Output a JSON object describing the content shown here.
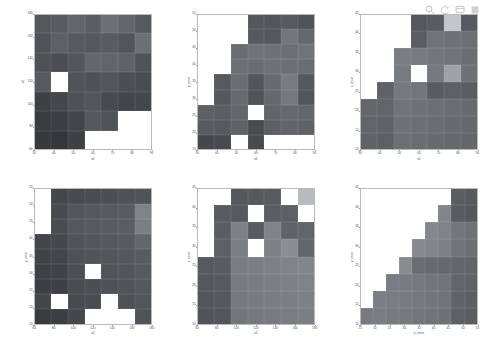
{
  "figure": {
    "background": "#ffffff",
    "layout": "2x3 subplot grid of pairwise 2-D histogram / heatmap panels",
    "empty_color": "#ffffff",
    "grid_line_color": "#b9b9b9"
  },
  "toolbar": {
    "items": [
      {
        "name": "zoom-icon",
        "label": "Zoom"
      },
      {
        "name": "pan-icon",
        "label": "Pan"
      },
      {
        "name": "datacursor-icon",
        "label": "Data Cursor"
      },
      {
        "name": "colorbar-icon",
        "label": "Colorbar"
      }
    ]
  },
  "chart_data": [
    {
      "id": "panel-x1-x2",
      "type": "heatmap",
      "title": "",
      "xlabel": "x1",
      "ylabel": "x2",
      "xticks": [
        30,
        40,
        50,
        60,
        70,
        80,
        90
      ],
      "yticks": [
        180,
        160,
        140,
        120,
        100,
        80,
        60
      ],
      "xlim": [
        25,
        95
      ],
      "ylim": [
        50,
        190
      ],
      "ncols": 7,
      "nrows": 7,
      "grid": true,
      "legend": "none",
      "note": "Values are cell shading levels (0 = darkest, 1 = brightest); null = empty / white cell",
      "values": [
        [
          0.2,
          0.22,
          0.26,
          0.23,
          0.31,
          0.27,
          0.21
        ],
        [
          0.18,
          0.24,
          0.21,
          0.2,
          0.22,
          0.19,
          0.31
        ],
        [
          0.17,
          0.16,
          0.19,
          0.27,
          0.26,
          0.25,
          0.18
        ],
        [
          0.21,
          1.0,
          0.18,
          0.17,
          0.19,
          0.16,
          0.15
        ],
        [
          0.1,
          0.13,
          0.17,
          0.19,
          0.14,
          0.12,
          0.13
        ],
        [
          0.08,
          0.09,
          0.12,
          0.2,
          0.18,
          null,
          null
        ],
        [
          0.07,
          0.06,
          0.1,
          null,
          null,
          null,
          null
        ]
      ]
    },
    {
      "id": "panel-x1-yerror",
      "type": "heatmap",
      "title": "",
      "xlabel": "x1",
      "ylabel": "y_error",
      "xticks": [
        30,
        40,
        50,
        60,
        70,
        80,
        90
      ],
      "yticks": [
        55,
        50,
        45,
        40,
        35,
        30,
        25,
        20,
        15
      ],
      "xlim": [
        25,
        95
      ],
      "ylim": [
        12,
        58
      ],
      "ncols": 7,
      "nrows": 9,
      "grid": true,
      "legend": "none",
      "values": [
        [
          null,
          null,
          null,
          0.2,
          0.19,
          0.21,
          0.18
        ],
        [
          null,
          null,
          null,
          0.21,
          0.2,
          0.34,
          0.28
        ],
        [
          null,
          null,
          0.3,
          0.33,
          0.32,
          0.31,
          0.33
        ],
        [
          null,
          null,
          0.31,
          0.3,
          0.32,
          0.31,
          0.3
        ],
        [
          null,
          0.21,
          0.3,
          0.19,
          0.29,
          0.36,
          0.2
        ],
        [
          null,
          0.2,
          0.29,
          0.18,
          0.28,
          0.35,
          0.19
        ],
        [
          0.24,
          0.23,
          0.27,
          1.0,
          0.26,
          0.28,
          0.27
        ],
        [
          0.22,
          0.21,
          0.25,
          0.15,
          0.24,
          0.26,
          0.25
        ],
        [
          0.13,
          0.14,
          null,
          0.14,
          null,
          null,
          null
        ]
      ]
    },
    {
      "id": "panel-x1-xerror",
      "type": "heatmap",
      "title": "",
      "xlabel": "x1",
      "ylabel": "x_error",
      "xticks": [
        30,
        40,
        50,
        60,
        70,
        80,
        90
      ],
      "yticks": [
        45,
        40,
        35,
        30,
        25,
        20,
        15,
        10
      ],
      "xlim": [
        25,
        95
      ],
      "ylim": [
        8,
        48
      ],
      "ncols": 7,
      "nrows": 8,
      "grid": true,
      "legend": "none",
      "values": [
        [
          null,
          null,
          null,
          0.2,
          0.22,
          0.72,
          0.21
        ],
        [
          null,
          null,
          null,
          0.23,
          0.33,
          0.32,
          0.31
        ],
        [
          null,
          null,
          0.37,
          0.36,
          0.34,
          0.33,
          0.3
        ],
        [
          null,
          null,
          0.36,
          1.0,
          0.35,
          0.55,
          0.32
        ],
        [
          null,
          0.25,
          0.35,
          0.34,
          0.22,
          0.24,
          0.23
        ],
        [
          0.27,
          0.26,
          0.33,
          0.32,
          0.31,
          0.3,
          0.29
        ],
        [
          0.26,
          0.25,
          0.32,
          0.31,
          0.3,
          0.29,
          0.28
        ],
        [
          0.25,
          0.24,
          0.31,
          0.3,
          0.29,
          0.28,
          0.27
        ]
      ]
    },
    {
      "id": "panel-x2-yerror",
      "type": "heatmap",
      "title": "",
      "xlabel": "x2",
      "ylabel": "y_error",
      "xticks": [
        60,
        80,
        100,
        120,
        140,
        160,
        180
      ],
      "yticks": [
        55,
        50,
        45,
        40,
        35,
        30,
        25,
        20,
        15
      ],
      "xlim": [
        50,
        190
      ],
      "ylim": [
        12,
        58
      ],
      "ncols": 7,
      "nrows": 9,
      "grid": true,
      "legend": "none",
      "values": [
        [
          null,
          0.13,
          0.14,
          0.15,
          0.16,
          0.17,
          0.18
        ],
        [
          null,
          0.14,
          0.19,
          0.2,
          0.21,
          0.22,
          0.4
        ],
        [
          null,
          0.15,
          0.2,
          0.21,
          0.22,
          0.23,
          0.38
        ],
        [
          0.12,
          0.13,
          0.18,
          0.19,
          0.2,
          0.21,
          0.27
        ],
        [
          0.11,
          0.12,
          0.17,
          0.18,
          0.19,
          0.2,
          0.22
        ],
        [
          0.1,
          0.11,
          0.16,
          1.0,
          0.18,
          0.19,
          0.21
        ],
        [
          0.09,
          0.1,
          0.15,
          0.16,
          0.17,
          0.18,
          0.2
        ],
        [
          0.12,
          1.0,
          0.14,
          0.15,
          null,
          0.17,
          0.19
        ],
        [
          0.08,
          0.09,
          0.13,
          null,
          null,
          null,
          0.18
        ]
      ]
    },
    {
      "id": "panel-x2-xerror",
      "type": "heatmap",
      "title": "",
      "xlabel": "x2",
      "ylabel": "x_error",
      "xticks": [
        60,
        80,
        100,
        120,
        140,
        160,
        180
      ],
      "yticks": [
        45,
        40,
        35,
        30,
        25,
        20,
        15,
        10
      ],
      "xlim": [
        50,
        190
      ],
      "ylim": [
        8,
        48
      ],
      "ncols": 7,
      "nrows": 8,
      "grid": true,
      "legend": "none",
      "values": [
        [
          null,
          null,
          0.2,
          0.21,
          0.22,
          null,
          0.66
        ],
        [
          null,
          0.22,
          0.21,
          1.0,
          0.23,
          0.24,
          null
        ],
        [
          null,
          0.23,
          0.39,
          0.22,
          0.4,
          0.25,
          0.26
        ],
        [
          null,
          0.24,
          0.38,
          1.0,
          0.39,
          0.45,
          0.27
        ],
        [
          0.21,
          0.22,
          0.37,
          0.38,
          0.39,
          0.4,
          0.41
        ],
        [
          0.2,
          0.21,
          0.36,
          0.37,
          0.38,
          0.39,
          0.4
        ],
        [
          0.19,
          0.2,
          0.35,
          0.36,
          0.37,
          0.38,
          0.39
        ],
        [
          0.18,
          0.19,
          0.34,
          0.35,
          0.36,
          0.37,
          0.38
        ]
      ]
    },
    {
      "id": "panel-xerror-yerror",
      "type": "heatmap",
      "title": "",
      "xlabel": "x_error",
      "ylabel": "y_error",
      "xticks": [
        15,
        20,
        25,
        30,
        35,
        40,
        45,
        50,
        55
      ],
      "yticks": [
        45,
        40,
        35,
        30,
        25,
        20,
        15,
        10
      ],
      "xlim": [
        12,
        58
      ],
      "ylim": [
        8,
        48
      ],
      "ncols": 9,
      "nrows": 8,
      "grid": true,
      "legend": "none",
      "note": "Lower-triangular wedge; cells only exist where x_error >= y_error",
      "values": [
        [
          null,
          null,
          null,
          null,
          null,
          null,
          null,
          0.23,
          0.21
        ],
        [
          null,
          null,
          null,
          null,
          null,
          null,
          0.41,
          0.22,
          0.2
        ],
        [
          null,
          null,
          null,
          null,
          null,
          0.42,
          0.4,
          0.34,
          0.32
        ],
        [
          null,
          null,
          null,
          null,
          0.43,
          0.41,
          0.39,
          0.33,
          0.31
        ],
        [
          null,
          null,
          null,
          0.44,
          0.3,
          0.29,
          0.28,
          0.27,
          0.26
        ],
        [
          null,
          null,
          0.37,
          0.36,
          0.35,
          0.34,
          0.33,
          0.26,
          0.25
        ],
        [
          null,
          0.38,
          0.37,
          0.36,
          0.35,
          0.34,
          0.33,
          0.25,
          0.24
        ],
        [
          0.36,
          0.37,
          0.36,
          0.35,
          0.34,
          0.33,
          0.32,
          0.24,
          0.23
        ]
      ]
    }
  ]
}
